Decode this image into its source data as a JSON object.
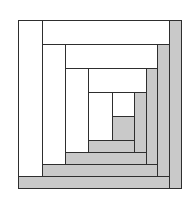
{
  "colors": {
    "light": "#ffffff",
    "dark": "#c9c9c9",
    "outline": "#2e2e2e"
  },
  "pieces": [
    {
      "id": "center",
      "tone": "dark",
      "x": 112,
      "y": 116,
      "w": 22,
      "h": 24
    },
    {
      "id": "round1-top",
      "tone": "light",
      "x": 112,
      "y": 92,
      "w": 22,
      "h": 24
    },
    {
      "id": "round1-left",
      "tone": "light",
      "x": 88,
      "y": 92,
      "w": 24,
      "h": 48
    },
    {
      "id": "round1-bottom",
      "tone": "dark",
      "x": 88,
      "y": 140,
      "w": 46,
      "h": 12
    },
    {
      "id": "round1-right",
      "tone": "dark",
      "x": 134,
      "y": 92,
      "w": 12,
      "h": 60
    },
    {
      "id": "round2-top",
      "tone": "light",
      "x": 88,
      "y": 68,
      "w": 58,
      "h": 24
    },
    {
      "id": "round2-left",
      "tone": "light",
      "x": 65,
      "y": 68,
      "w": 23,
      "h": 84
    },
    {
      "id": "round2-bottom",
      "tone": "dark",
      "x": 65,
      "y": 152,
      "w": 81,
      "h": 12
    },
    {
      "id": "round2-right",
      "tone": "dark",
      "x": 146,
      "y": 68,
      "w": 11,
      "h": 96
    },
    {
      "id": "round3-top",
      "tone": "light",
      "x": 65,
      "y": 44,
      "w": 92,
      "h": 24
    },
    {
      "id": "round3-left",
      "tone": "light",
      "x": 42,
      "y": 44,
      "w": 23,
      "h": 120
    },
    {
      "id": "round3-bottom",
      "tone": "dark",
      "x": 42,
      "y": 164,
      "w": 115,
      "h": 12
    },
    {
      "id": "round3-right",
      "tone": "dark",
      "x": 157,
      "y": 44,
      "w": 12,
      "h": 132
    },
    {
      "id": "round4-top",
      "tone": "light",
      "x": 42,
      "y": 20,
      "w": 127,
      "h": 24
    },
    {
      "id": "round4-left",
      "tone": "light",
      "x": 18,
      "y": 20,
      "w": 24,
      "h": 156
    },
    {
      "id": "round4-bottom",
      "tone": "dark",
      "x": 18,
      "y": 176,
      "w": 151,
      "h": 12
    },
    {
      "id": "round4-right",
      "tone": "dark",
      "x": 169,
      "y": 20,
      "w": 12,
      "h": 168
    }
  ]
}
